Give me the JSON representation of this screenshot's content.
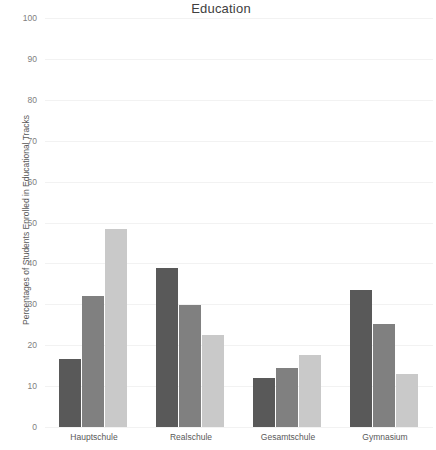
{
  "chart_data": {
    "type": "bar",
    "title": "Education",
    "xlabel": "",
    "ylabel": "Percentages of Students Enrolled in Educational Tracks",
    "ylim": [
      0,
      100
    ],
    "yticks": [
      0,
      10,
      20,
      30,
      40,
      50,
      60,
      70,
      80,
      90,
      100
    ],
    "ytick_labels": [
      "0",
      "10",
      "20",
      "30",
      "40",
      "50",
      "60",
      "70",
      "80",
      "90",
      "100"
    ],
    "grid": true,
    "legend": "none",
    "categories": [
      "Hauptschule",
      "Realschule",
      "Gesamtschule",
      "Gymnasium"
    ],
    "series": [
      {
        "name": "Series 1",
        "color": "#595959",
        "values": [
          16.6,
          39.0,
          12.0,
          33.5
        ]
      },
      {
        "name": "Series 2",
        "color": "#808080",
        "values": [
          32.0,
          29.8,
          14.5,
          25.2
        ]
      },
      {
        "name": "Series 3",
        "color": "#c9c9c9",
        "values": [
          48.5,
          22.4,
          17.5,
          13.0
        ]
      }
    ]
  }
}
